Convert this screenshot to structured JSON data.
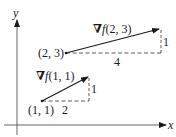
{
  "diagram": {
    "title": "",
    "axes": {
      "x_label": "x",
      "y_label": "y"
    },
    "vectors": [
      {
        "base_point_label": "(1, 1)",
        "gradient_label_nabla": "∇",
        "gradient_label_f": "f",
        "gradient_label_args": "(1, 1)",
        "horizontal_component_label": "2",
        "vertical_component_label": "1"
      },
      {
        "base_point_label": "(2, 3)",
        "gradient_label_nabla": "∇",
        "gradient_label_f": "f",
        "gradient_label_args": "(2, 3)",
        "horizontal_component_label": "4",
        "vertical_component_label": "1"
      }
    ],
    "colors": {
      "ink": "#1a1a1a",
      "dash": "#333333",
      "background": "#ffffff"
    }
  }
}
